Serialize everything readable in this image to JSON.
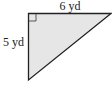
{
  "figure": {
    "type": "right-triangle",
    "fill_color": "#e6e6e6",
    "stroke_color": "#222222",
    "top_side_label": "6 yd",
    "left_side_label": "5 yd",
    "right_angle_marker": true
  }
}
